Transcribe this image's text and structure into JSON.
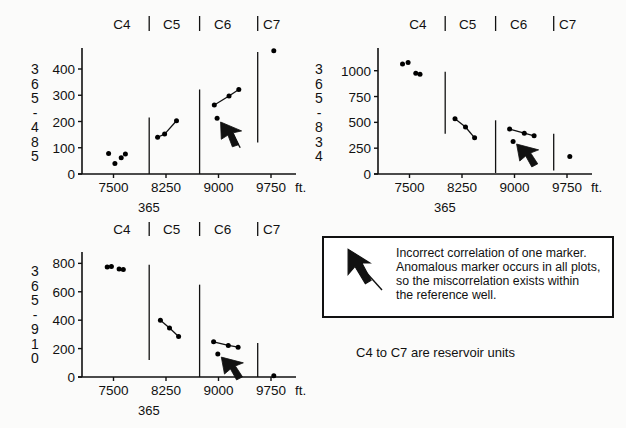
{
  "figure": {
    "caption": "C4 to C7 are reservoir units",
    "note": {
      "line1": "Incorrect correlation of one marker.",
      "line2": "Anomalous marker occurs in all plots,",
      "line3": "so the miscorrelation exists within",
      "line4": "the reference well.",
      "arrow_icon": "arrow-up-left-icon"
    },
    "colors": {
      "ink": "#111111",
      "paper": "#fbfbfa",
      "marker": "#000000"
    }
  },
  "chart_data": [
    {
      "id": "plot-365-485",
      "type": "scatter",
      "title": "",
      "ylabel": "365-485",
      "xlabel": "365",
      "x_unit": "ft.",
      "xticks": [
        7500,
        8250,
        9000,
        9750
      ],
      "yticks": [
        0,
        100,
        200,
        300,
        400
      ],
      "xlim": [
        7050,
        10050
      ],
      "ylim": [
        0,
        480
      ],
      "grid": false,
      "unit_labels": [
        "C4",
        "C5",
        "C6",
        "C7"
      ],
      "unit_label_x": [
        7620,
        8330,
        9060,
        9760
      ],
      "unit_boundaries": [
        8010,
        8730,
        9560
      ],
      "boundary_tops": [
        {
          "x": 8010,
          "y_top": 215,
          "y_bottom": 0
        },
        {
          "x": 8730,
          "y_top": 322,
          "y_bottom": 0
        },
        {
          "x": 9560,
          "y_top": 465,
          "y_bottom": 120
        }
      ],
      "series": [
        {
          "name": "C4",
          "connected": false,
          "points": [
            [
              7430,
              78
            ],
            [
              7520,
              40
            ],
            [
              7610,
              62
            ],
            [
              7670,
              76
            ]
          ]
        },
        {
          "name": "C5",
          "connected": true,
          "points": [
            [
              8130,
              140
            ],
            [
              8230,
              152
            ],
            [
              8400,
              203
            ]
          ]
        },
        {
          "name": "C6",
          "connected": true,
          "points": [
            [
              8940,
              263
            ],
            [
              9150,
              297
            ],
            [
              9290,
              322
            ]
          ]
        },
        {
          "name": "C6-anomalous",
          "connected": false,
          "points": [
            [
              8980,
              212
            ]
          ]
        },
        {
          "name": "C7",
          "connected": false,
          "points": [
            [
              9790,
              470
            ]
          ]
        }
      ],
      "annotation_arrow": {
        "tip": [
          9030,
          198
        ],
        "tail": [
          9310,
          100
        ]
      }
    },
    {
      "id": "plot-365-834",
      "type": "scatter",
      "title": "",
      "ylabel": "365-834",
      "xlabel": "365",
      "x_unit": "ft.",
      "xticks": [
        7500,
        8250,
        9000,
        9750
      ],
      "yticks": [
        0,
        250,
        500,
        750,
        1000
      ],
      "xlim": [
        7050,
        10050
      ],
      "ylim": [
        0,
        1220
      ],
      "grid": false,
      "unit_labels": [
        "C4",
        "C5",
        "C6",
        "C7"
      ],
      "unit_label_x": [
        7620,
        8330,
        9060,
        9760
      ],
      "unit_boundaries": [
        8010,
        8730,
        9560
      ],
      "boundary_tops": [
        {
          "x": 8010,
          "y_top": 990,
          "y_bottom": 390
        },
        {
          "x": 8730,
          "y_top": 520,
          "y_bottom": 10
        },
        {
          "x": 9560,
          "y_top": 390,
          "y_bottom": 35
        }
      ],
      "series": [
        {
          "name": "C4",
          "connected": false,
          "points": [
            [
              7400,
              1065
            ],
            [
              7480,
              1080
            ],
            [
              7590,
              975
            ],
            [
              7650,
              965
            ]
          ]
        },
        {
          "name": "C5",
          "connected": true,
          "points": [
            [
              8150,
              535
            ],
            [
              8300,
              455
            ],
            [
              8430,
              350
            ]
          ]
        },
        {
          "name": "C6",
          "connected": true,
          "points": [
            [
              8930,
              435
            ],
            [
              9140,
              395
            ],
            [
              9280,
              370
            ]
          ]
        },
        {
          "name": "C6-anomalous",
          "connected": false,
          "points": [
            [
              8980,
              315
            ]
          ]
        },
        {
          "name": "C7",
          "connected": false,
          "points": [
            [
              9790,
              170
            ]
          ]
        }
      ],
      "annotation_arrow": {
        "tip": [
          9030,
          290
        ],
        "tail": [
          9300,
          110
        ]
      }
    },
    {
      "id": "plot-365-910",
      "type": "scatter",
      "title": "",
      "ylabel": "365-910",
      "xlabel": "365",
      "x_unit": "ft.",
      "xticks": [
        7500,
        8250,
        9000,
        9750
      ],
      "yticks": [
        0,
        200,
        400,
        600,
        800
      ],
      "xlim": [
        7050,
        10050
      ],
      "ylim": [
        0,
        880
      ],
      "grid": false,
      "unit_labels": [
        "C4",
        "C5",
        "C6",
        "C7"
      ],
      "unit_label_x": [
        7620,
        8330,
        9060,
        9760
      ],
      "unit_boundaries": [
        8010,
        8730,
        9560
      ],
      "boundary_tops": [
        {
          "x": 8010,
          "y_top": 790,
          "y_bottom": 120
        },
        {
          "x": 8730,
          "y_top": 650,
          "y_bottom": 0
        },
        {
          "x": 9560,
          "y_top": 240,
          "y_bottom": 0
        }
      ],
      "series": [
        {
          "name": "C4",
          "connected": false,
          "points": [
            [
              7410,
              775
            ],
            [
              7470,
              778
            ],
            [
              7580,
              760
            ],
            [
              7640,
              757
            ]
          ]
        },
        {
          "name": "C5",
          "connected": true,
          "points": [
            [
              8170,
              400
            ],
            [
              8300,
              345
            ],
            [
              8430,
              285
            ]
          ]
        },
        {
          "name": "C6",
          "connected": true,
          "points": [
            [
              8930,
              248
            ],
            [
              9140,
              222
            ],
            [
              9280,
              210
            ]
          ]
        },
        {
          "name": "C6-anomalous",
          "connected": false,
          "points": [
            [
              8990,
              162
            ]
          ]
        },
        {
          "name": "C7",
          "connected": false,
          "points": [
            [
              9790,
              8
            ]
          ]
        }
      ],
      "annotation_arrow": {
        "tip": [
          9040,
          140
        ],
        "tail": [
          9310,
          10
        ]
      }
    }
  ]
}
